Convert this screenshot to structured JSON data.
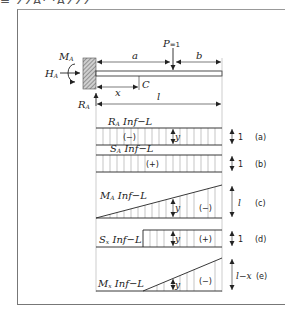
{
  "header": {
    "clipped_text": "= ΣΣΑ·  ·ΑΣΣΣ"
  },
  "beam": {
    "labels": {
      "moment": "M",
      "moment_sub": "A",
      "horizontal": "H",
      "horizontal_sub": "A",
      "reaction": "R",
      "reaction_sub": "A",
      "load": "P",
      "load_value": "=1",
      "dim_a": "a",
      "dim_b": "b",
      "dim_x": "x",
      "point_c": "C",
      "dim_l": "l"
    }
  },
  "influence_lines": [
    {
      "id": "a",
      "title": "R",
      "title_sub": "A",
      "title_rest": " Inf−L",
      "sign": "(−)",
      "ordinate": "y",
      "magnitude": "1",
      "tag": "(a)",
      "shape": "rectangle"
    },
    {
      "id": "b",
      "title": "S",
      "title_sub": "A",
      "title_rest": " Inf−L",
      "sign": "(+)",
      "ordinate": "",
      "magnitude": "1",
      "tag": "(b)",
      "shape": "rectangle"
    },
    {
      "id": "c",
      "title": "M",
      "title_sub": "A",
      "title_rest": " Inf−L",
      "sign": "(−)",
      "ordinate": "y",
      "magnitude": "l",
      "tag": "(c)",
      "shape": "triangle"
    },
    {
      "id": "d",
      "title": "S",
      "title_sub": "x",
      "title_rest": " Inf−L",
      "sign": "(+)",
      "ordinate": "y",
      "magnitude": "1",
      "tag": "(d)",
      "shape": "partial-rectangle"
    },
    {
      "id": "e",
      "title": "M",
      "title_sub": "x",
      "title_rest": " Inf−L",
      "sign": "(−)",
      "ordinate": "y",
      "magnitude": "l−x",
      "tag": "(e)",
      "shape": "partial-triangle"
    }
  ],
  "colors": {
    "line": "#222222",
    "hatch": "#555555",
    "frame": "#777777",
    "hatch_fill": "#bbbbbb"
  }
}
